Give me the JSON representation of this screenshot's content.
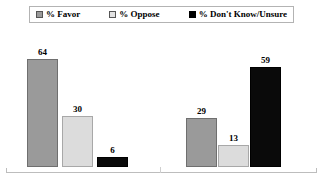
{
  "chart_data": {
    "type": "bar",
    "title": "",
    "xlabel": "",
    "ylabel": "",
    "ylim": [
      0,
      100
    ],
    "grid": false,
    "legend_position": "top",
    "categories": [
      "Group 1",
      "Group 2"
    ],
    "series": [
      {
        "name": "% Favor",
        "color": "#9a9a9a",
        "values": [
          64,
          29
        ]
      },
      {
        "name": "% Oppose",
        "color": "#dcdcdc",
        "values": [
          30,
          13
        ]
      },
      {
        "name": "% Don't Know/Unsure",
        "color": "#000000",
        "values": [
          6,
          59
        ]
      }
    ],
    "bars": [
      {
        "group": 0,
        "series": "% Favor",
        "value": 64,
        "label": "64"
      },
      {
        "group": 0,
        "series": "% Oppose",
        "value": 30,
        "label": "30"
      },
      {
        "group": 0,
        "series": "% Don't Know/Unsure",
        "value": 6,
        "label": "6"
      },
      {
        "group": 1,
        "series": "% Favor",
        "value": 29,
        "label": "29"
      },
      {
        "group": 1,
        "series": "% Oppose",
        "value": 13,
        "label": "13"
      },
      {
        "group": 1,
        "series": "% Don't Know/Unsure",
        "value": 59,
        "label": "59"
      }
    ]
  },
  "legend": {
    "items": [
      {
        "label": "% Favor",
        "swatch": "favor-swatch"
      },
      {
        "label": "% Oppose",
        "swatch": "oppose-swatch"
      },
      {
        "label": "% Don't Know/Unsure",
        "swatch": "dont-know-swatch"
      }
    ]
  }
}
